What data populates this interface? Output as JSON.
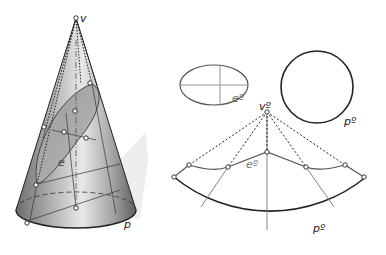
{
  "figure": {
    "type": "geometry-development-diagram",
    "left": {
      "title": "cone-with-ellipse-section",
      "labels": {
        "vertex": "v",
        "ellipse": "e",
        "base": "p"
      }
    },
    "right": {
      "ellipse_true_shape": {
        "label": "eº"
      },
      "base_circle": {
        "label": "pº"
      },
      "development": {
        "vertex_label": "vº",
        "curve_label": "eº",
        "arc_label": "pº"
      }
    },
    "colors": {
      "stroke": "#222222",
      "gray_line": "#777777",
      "cone_fill_dark": "#7a7a7a",
      "cone_fill_light": "#e6e6e6",
      "shadow": "#ececec"
    }
  }
}
